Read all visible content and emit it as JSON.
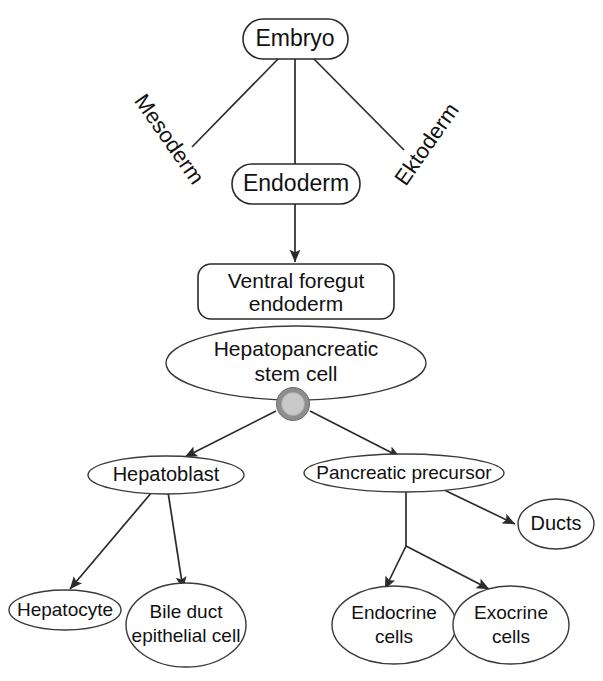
{
  "diagram": {
    "colors": {
      "stroke": "#2a2a2a",
      "text": "#111111",
      "background": "#ffffff",
      "cell_outer_ring": "#8d8d8d",
      "cell_inner_fill": "#c9c9c9"
    },
    "nodes": {
      "embryo": {
        "label": "Embryo",
        "shape": "rounded-rect"
      },
      "endoderm": {
        "label": "Endoderm",
        "shape": "rounded-rect"
      },
      "ventral_foregut_line1": "Ventral foregut",
      "ventral_foregut_line2": "endoderm",
      "stem_cell_line1": "Hepatopancreatic",
      "stem_cell_line2": "stem cell",
      "hepatoblast": {
        "label": "Hepatoblast",
        "shape": "ellipse"
      },
      "pancreatic_precursor": {
        "label": "Pancreatic precursor",
        "shape": "ellipse"
      },
      "ducts": {
        "label": "Ducts",
        "shape": "ellipse"
      },
      "hepatocyte": {
        "label": "Hepatocyte",
        "shape": "ellipse"
      },
      "bile_duct_line1": "Bile duct",
      "bile_duct_line2": "epithelial cell",
      "endocrine_line1": "Endocrine",
      "endocrine_line2": "cells",
      "exocrine_line1": "Exocrine",
      "exocrine_line2": "cells"
    },
    "branch_labels": {
      "mesoderm": "Mesoderm",
      "ektoderm": "Ektoderm"
    },
    "cell_marker": {
      "name": "hepatopancreatic-stem-cell-marker"
    }
  }
}
